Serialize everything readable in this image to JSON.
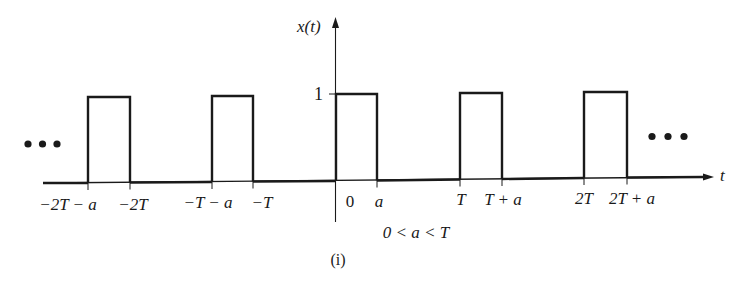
{
  "figure": {
    "y_axis_label": "x(t)",
    "x_axis_label": "t",
    "amplitude_label": "1",
    "constraint": "0 < a < T",
    "caption": "(i)",
    "colors": {
      "line": "#1a1a1a",
      "background": "#ffffff"
    }
  },
  "tick_labels": [
    {
      "text": "−2T − a",
      "x": 68
    },
    {
      "text": "−2T",
      "x": 133
    },
    {
      "text": "−T − a",
      "x": 208
    },
    {
      "text": "−T",
      "x": 262
    },
    {
      "text": "0",
      "x": 350
    },
    {
      "text": "a",
      "x": 379
    },
    {
      "text": "T",
      "x": 461
    },
    {
      "text": "T + a",
      "x": 503
    },
    {
      "text": "2T",
      "x": 584
    },
    {
      "text": "2T + a",
      "x": 632
    }
  ],
  "pulses": [
    {
      "start": "−2T − a",
      "end": "−2T",
      "height": 1
    },
    {
      "start": "−T − a",
      "end": "−T",
      "height": 1
    },
    {
      "start": "0",
      "end": "a",
      "height": 1
    },
    {
      "start": "T",
      "end": "T + a",
      "height": 1
    },
    {
      "start": "2T",
      "end": "2T + a",
      "height": 1
    }
  ],
  "ellipsis": {
    "left": "•••",
    "right": "•••"
  }
}
